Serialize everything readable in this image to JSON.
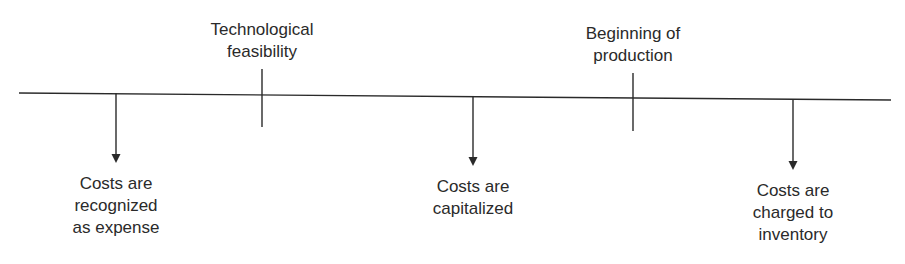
{
  "diagram": {
    "type": "timeline",
    "stroke_color": "#2a2a2a",
    "text_color": "#2a2a2a",
    "timeline": {
      "x1": 19,
      "y1": 93,
      "x2": 891,
      "y2": 100
    },
    "milestones": [
      {
        "id": "technological-feasibility",
        "lines": [
          "Technological",
          "feasibility"
        ],
        "x": 262,
        "tick_top": 69,
        "tick_bottom": 127,
        "label_top": 19
      },
      {
        "id": "beginning-of-production",
        "lines": [
          "Beginning of",
          "production"
        ],
        "x": 633,
        "tick_top": 73,
        "tick_bottom": 131,
        "label_top": 23
      }
    ],
    "outcomes": [
      {
        "id": "expense",
        "lines": [
          "Costs are",
          "recognized",
          "as expense"
        ],
        "x": 116,
        "arrow_top": 93,
        "arrow_tip": 163,
        "label_top": 173
      },
      {
        "id": "capitalized",
        "lines": [
          "Costs are",
          "capitalized"
        ],
        "x": 473,
        "arrow_top": 96,
        "arrow_tip": 166,
        "label_top": 176
      },
      {
        "id": "inventory",
        "lines": [
          "Costs are",
          "charged to",
          "inventory"
        ],
        "x": 793,
        "arrow_top": 99,
        "arrow_tip": 170,
        "label_top": 180
      }
    ]
  }
}
